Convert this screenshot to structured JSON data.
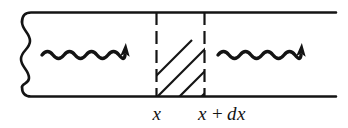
{
  "figure": {
    "background_color": "#ffffff",
    "ink_color": "#141414",
    "width": 348,
    "height": 128
  },
  "slab": {
    "name": "hatched-slab",
    "fill_pattern": "diagonal-hatch-45",
    "hatch_line_count": 4,
    "left_boundary_style": "dashed",
    "right_boundary_style": "dashed",
    "left_x_px": 156,
    "right_x_px": 205
  },
  "boundaries": {
    "top_line": "top-wall",
    "bottom_line": "bottom-wall",
    "left_edge": "wavy-broken-edge"
  },
  "beams": [
    {
      "name": "incoming-wavy-arrow",
      "direction": "right",
      "style": "sinusoidal-with-arrowhead"
    },
    {
      "name": "outgoing-wavy-arrow",
      "direction": "right",
      "style": "sinusoidal-with-arrowhead"
    }
  ],
  "labels": {
    "left_position": {
      "text": "x",
      "italic": true
    },
    "right_position": {
      "var1": "x",
      "operator": "+",
      "differential": "dx"
    }
  }
}
